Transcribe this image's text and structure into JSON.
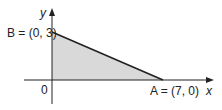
{
  "diagram": {
    "type": "coordinate-region",
    "axes": {
      "x_label": "x",
      "y_label": "y",
      "origin_label": "0"
    },
    "points": {
      "A": {
        "label": "A = (7, 0)",
        "x": 7,
        "y": 0
      },
      "B": {
        "label": "B = (0, 3)",
        "x": 0,
        "y": 3
      }
    },
    "region": {
      "description": "shaded triangle bounded by axes and segment AB",
      "fill": "#d9d9d9",
      "stroke": "#222222"
    }
  }
}
